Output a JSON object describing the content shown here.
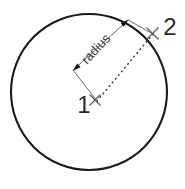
{
  "figure": {
    "kind": "geometry-diagram",
    "background_color": "#ffffff",
    "line_color": "#1a1a1a",
    "dim_line_color": "#555555",
    "dotted_line_color": "#3d3d3d",
    "text_color": "#2b2b2b"
  },
  "circle": {
    "center_x": 89,
    "center_y": 92,
    "radius": 78,
    "stroke_width": 2.1
  },
  "points": [
    {
      "id": "point-1",
      "label": "1",
      "role": "center",
      "x": 95,
      "y": 100,
      "label_x": 84,
      "label_y": 113,
      "marker": "x-marker",
      "font_size": 24
    },
    {
      "id": "point-2",
      "label": "2",
      "role": "on-circumference",
      "x": 152,
      "y": 33,
      "label_x": 170,
      "label_y": 35,
      "marker": "x-marker",
      "font_size": 24
    }
  ],
  "dimension": {
    "label": "radius",
    "font_size": 13,
    "rotation_deg": -47,
    "text_x": 99,
    "text_y": 52,
    "arrow_start_x": 73,
    "arrow_start_y": 70,
    "arrow_end_x": 128,
    "arrow_end_y": 20,
    "arrowheads": "both-ends",
    "offset_from_measured_line": 20
  },
  "measured_line": {
    "style": "dotted",
    "from_point": "point-1",
    "to_point": "point-2",
    "from_x": 97,
    "from_y": 101,
    "to_x": 153,
    "to_y": 34,
    "dot_size": 1.5
  },
  "extension_lines": [
    {
      "id": "ext-line-center",
      "from_x": 97,
      "from_y": 101,
      "to_x": 73,
      "to_y": 70
    },
    {
      "id": "ext-line-circumference",
      "from_x": 153,
      "from_y": 34,
      "to_x": 128,
      "to_y": 20
    }
  ]
}
